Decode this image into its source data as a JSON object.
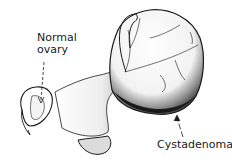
{
  "figure": {
    "labels": {
      "normal_ovary_line1": "Normal",
      "normal_ovary_line2": "ovary",
      "cystadenoma": "Cystadenoma"
    },
    "colors": {
      "ink": "#1a1a1a",
      "background": "#ffffff",
      "shade": "#3a3a3a"
    }
  }
}
